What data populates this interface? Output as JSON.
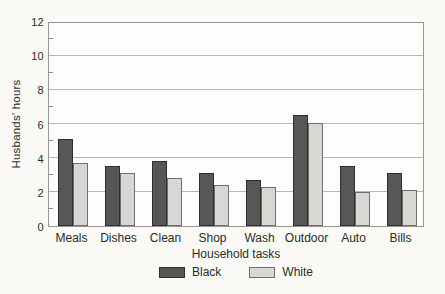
{
  "chart_data": {
    "type": "bar",
    "title": "",
    "xlabel": "Household tasks",
    "ylabel": "Husbands' hours",
    "categories": [
      "Meals",
      "Dishes",
      "Clean",
      "Shop",
      "Wash",
      "Outdoor",
      "Auto",
      "Bills"
    ],
    "series": [
      {
        "name": "Black",
        "color": "#575757",
        "border_color": "#2e2e2e",
        "values": [
          5.1,
          3.5,
          3.8,
          3.1,
          2.7,
          6.5,
          3.5,
          3.1
        ]
      },
      {
        "name": "White",
        "color": "#d8d7d3",
        "border_color": "#6f6f6f",
        "values": [
          3.7,
          3.1,
          2.8,
          2.4,
          2.3,
          6.0,
          2.0,
          2.1
        ]
      }
    ],
    "ylim": [
      0,
      12
    ],
    "yticks": [
      0,
      2,
      4,
      6,
      8,
      10,
      12
    ],
    "yticks_minor": [
      1,
      3,
      5,
      7,
      9,
      11
    ],
    "grid": true,
    "legend_position": "bottom",
    "colors": {
      "background": "#fbfaf7",
      "gridline": "#b7b7b5",
      "frame": "#969696",
      "text": "#2a2a2a"
    }
  }
}
